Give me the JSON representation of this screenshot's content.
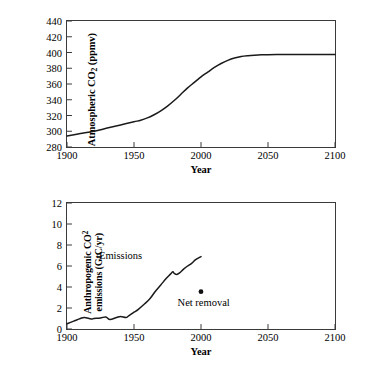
{
  "figure": {
    "panels": [
      {
        "id": "atmospheric-co2",
        "ytitle_line1_pre": "Atmospheric CO",
        "ytitle_line1_sub": "2",
        "ytitle_line1_post": " (ppmv)",
        "xtitle": "Year",
        "yticks": [
          "280",
          "300",
          "320",
          "340",
          "360",
          "380",
          "400",
          "420",
          "440"
        ],
        "xticks": [
          "1900",
          "1950",
          "2000",
          "2050",
          "2100"
        ]
      },
      {
        "id": "anthropogenic-emissions",
        "ytitle_line1_pre": "Anthropogenic CO",
        "ytitle_line1_sub": "2",
        "ytitle_line2": "emissions (GtC/yr)",
        "xtitle": "Year",
        "yticks": [
          "0",
          "2",
          "4",
          "6",
          "8",
          "10",
          "12"
        ],
        "xticks": [
          "1900",
          "1950",
          "2000",
          "2050",
          "2100"
        ],
        "annotations": [
          {
            "name": "emissions-series-label",
            "text": "Emissions",
            "x": 1940,
            "y": 7.05
          },
          {
            "name": "net-removal-label",
            "text": "Net removal",
            "x": 2002,
            "y": 2.55
          }
        ]
      }
    ]
  },
  "chart_data": [
    {
      "type": "line",
      "id": "atmospheric-co2",
      "title": "",
      "xlabel": "Year",
      "ylabel": "Atmospheric CO2 (ppmv)",
      "xlim": [
        1900,
        2100
      ],
      "ylim": [
        280,
        440
      ],
      "xticks": [
        1900,
        1950,
        2000,
        2050,
        2100
      ],
      "yticks": [
        280,
        300,
        320,
        340,
        360,
        380,
        400,
        420,
        440
      ],
      "grid": false,
      "legend": "none",
      "series": [
        {
          "name": "Atmospheric CO2 concentration",
          "x": [
            1900,
            1910,
            1920,
            1930,
            1940,
            1950,
            1955,
            1960,
            1965,
            1970,
            1975,
            1980,
            1985,
            1990,
            1995,
            2000,
            2005,
            2010,
            2015,
            2020,
            2025,
            2030,
            2035,
            2040,
            2045,
            2050,
            2060,
            2070,
            2080,
            2090,
            2100
          ],
          "values": [
            294,
            297,
            300,
            304,
            308,
            312,
            314,
            317,
            321,
            326,
            332,
            339,
            347,
            355,
            362,
            369,
            375,
            381,
            386,
            390,
            393,
            395,
            396,
            396.6,
            397,
            397.2,
            397.4,
            397.5,
            397.5,
            397.5,
            397.5
          ]
        }
      ]
    },
    {
      "type": "line",
      "id": "anthropogenic-emissions",
      "title": "",
      "xlabel": "Year",
      "ylabel": "Anthropogenic CO2 emissions (GtC/yr)",
      "xlim": [
        1900,
        2100
      ],
      "ylim": [
        0,
        12
      ],
      "xticks": [
        1900,
        1950,
        2000,
        2050,
        2100
      ],
      "yticks": [
        0,
        2,
        4,
        6,
        8,
        10,
        12
      ],
      "grid": false,
      "legend": "none",
      "series": [
        {
          "name": "Emissions",
          "x": [
            1900,
            1905,
            1910,
            1913,
            1918,
            1920,
            1925,
            1929,
            1932,
            1937,
            1940,
            1944,
            1946,
            1950,
            1953,
            1958,
            1962,
            1966,
            1970,
            1974,
            1977,
            1979,
            1980,
            1982,
            1984,
            1987,
            1990,
            1993,
            1996,
            2000
          ],
          "values": [
            0.5,
            0.75,
            1.0,
            1.1,
            0.95,
            1.0,
            1.05,
            1.15,
            0.9,
            1.1,
            1.2,
            1.1,
            1.25,
            1.6,
            1.85,
            2.4,
            2.9,
            3.6,
            4.2,
            4.8,
            5.2,
            5.45,
            5.3,
            5.2,
            5.35,
            5.7,
            6.0,
            6.25,
            6.6,
            6.9
          ]
        }
      ],
      "points": [
        {
          "name": "Net removal",
          "x": 2000,
          "y": 3.55,
          "marker": "filled-circle"
        }
      ],
      "annotations": [
        {
          "text": "Emissions",
          "x": 1940,
          "y": 7.05
        },
        {
          "text": "Net removal",
          "x": 2002,
          "y": 2.55
        }
      ]
    }
  ]
}
